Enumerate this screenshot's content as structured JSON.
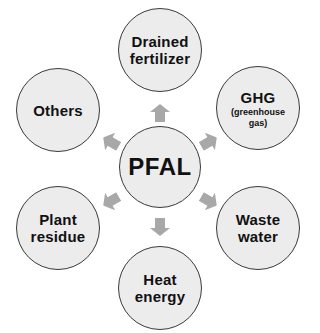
{
  "diagram": {
    "type": "hub-and-spoke",
    "center": {
      "label": "PFAL"
    },
    "outputs": [
      {
        "id": "drained-fertilizer",
        "label_line1": "Drained",
        "label_line2": "fertilizer",
        "position": "top"
      },
      {
        "id": "ghg",
        "label_line1": "GHG",
        "sub_line1": "(greenhouse",
        "sub_line2": "gas)",
        "position": "top-right"
      },
      {
        "id": "waste-water",
        "label_line1": "Waste",
        "label_line2": "water",
        "position": "bottom-right"
      },
      {
        "id": "heat-energy",
        "label_line1": "Heat",
        "label_line2": "energy",
        "position": "bottom"
      },
      {
        "id": "plant-residue",
        "label_line1": "Plant",
        "label_line2": "residue",
        "position": "bottom-left"
      },
      {
        "id": "others",
        "label_line1": "Others",
        "position": "top-left"
      }
    ],
    "colors": {
      "node_fill": "#ececec",
      "node_border": "#3a3a3a",
      "arrow_fill": "#a8a8a8",
      "text": "#111111",
      "background": "#ffffff"
    }
  }
}
